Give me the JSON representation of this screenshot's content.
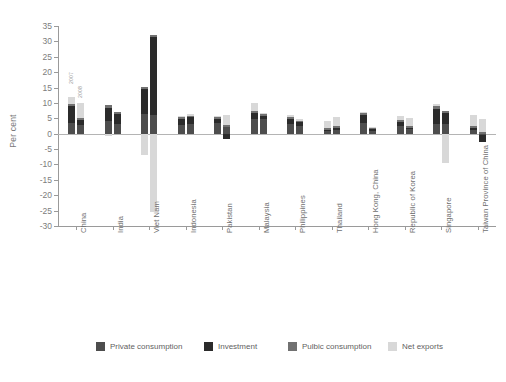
{
  "chart_data": {
    "type": "bar",
    "title": "",
    "xlabel": "",
    "ylabel": "Per cent",
    "ylim": [
      -30,
      35
    ],
    "ytick_step": 5,
    "yticks": [
      35,
      30,
      25,
      20,
      15,
      10,
      5,
      0,
      -5,
      -10,
      -15,
      -20,
      -25,
      -30
    ],
    "ytick_labels": [
      "35",
      "30",
      "25",
      "20",
      "15",
      "10",
      "5",
      "0",
      "-5",
      "-10",
      "-15",
      "-20",
      "-25",
      "-30"
    ],
    "grid": false,
    "legend_position": "bottom",
    "stacked": true,
    "categories": [
      "China",
      "India",
      "Viet Nam",
      "Indonesia",
      "Pakistan",
      "Malaysia",
      "Philippines",
      "Thailand",
      "Hong Kong, China",
      "Republic of Korea",
      "Singapore",
      "Taiwan Province of China"
    ],
    "subgroups": [
      "2007",
      "2008"
    ],
    "series": [
      {
        "name": "Private consumption",
        "color": "#4d4d4d",
        "values_2007": [
          3.4,
          4.2,
          6.4,
          2.9,
          3.6,
          4.9,
          3.2,
          1.0,
          3.4,
          2.6,
          3.1,
          1.3
        ],
        "values_2008": [
          2.7,
          3.0,
          6.1,
          3.1,
          2.2,
          4.7,
          2.6,
          1.3,
          1.0,
          1.4,
          3.0,
          -0.3
        ]
      },
      {
        "name": "Investment",
        "color": "#2b2b2b",
        "values_2007": [
          5.5,
          4.3,
          8.2,
          1.9,
          1.2,
          1.8,
          1.7,
          0.3,
          2.8,
          1.2,
          5.0,
          0.6
        ],
        "values_2008": [
          1.6,
          3.3,
          25.2,
          2.2,
          -1.6,
          1.1,
          1.2,
          0.5,
          0.4,
          0.5,
          3.6,
          -2.5
        ]
      },
      {
        "name": "Pulbic consumption",
        "color": "#717171",
        "values_2007": [
          0.9,
          0.7,
          0.7,
          0.6,
          0.7,
          0.6,
          0.5,
          0.5,
          0.5,
          0.6,
          0.8,
          0.5
        ],
        "values_2008": [
          0.8,
          0.6,
          0.8,
          0.6,
          0.6,
          0.6,
          0.4,
          0.6,
          0.3,
          0.6,
          0.7,
          0.5
        ]
      },
      {
        "name": "Net exports",
        "color": "#d8d8d8",
        "values_2007": [
          2.1,
          -0.6,
          -6.8,
          0.4,
          0.2,
          2.6,
          0.7,
          2.3,
          0.4,
          1.2,
          0.9,
          3.6
        ],
        "values_2008": [
          4.9,
          0.0,
          -25.4,
          0.6,
          3.4,
          0.4,
          0.5,
          3.0,
          0.5,
          2.5,
          -9.6,
          4.4
        ]
      }
    ],
    "annotations": [
      {
        "text": "2007",
        "category": "China",
        "subgroup": "2007"
      },
      {
        "text": "2008",
        "category": "China",
        "subgroup": "2008"
      }
    ]
  },
  "legend": {
    "items": [
      {
        "label": "Private consumption",
        "color": "#4d4d4d"
      },
      {
        "label": "Investment",
        "color": "#2b2b2b"
      },
      {
        "label": "Pulbic consumption",
        "color": "#717171"
      },
      {
        "label": "Net exports",
        "color": "#d8d8d8"
      }
    ]
  },
  "footer": {
    "text": ""
  }
}
